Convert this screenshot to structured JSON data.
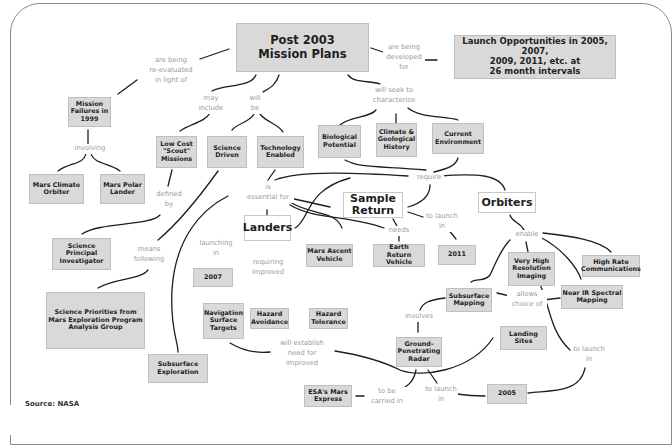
{
  "diagram": {
    "title": "Post 2003 Mission Plans",
    "source": "Source: NASA",
    "side_credit": "NASA / JOHN CHAPMAN",
    "colors": {
      "box_fill": "#d9d9d9",
      "box_border": "#bfbfbf",
      "label_text": "#9a9a9a",
      "line": "#1e1e1e",
      "frame": "#8a8a8a"
    },
    "nodes": {
      "post2003": "Post 2003\nMission Plans",
      "launch_opps": "Launch Opportunities in 2005, 2007,\n2009, 2011, etc. at\n26 month intervals",
      "mission_failures": "Mission\nFailures in\n1999",
      "mars_climate_orbiter": "Mars Climate\nOrbiter",
      "mars_polar_lander": "Mars Polar\nLander",
      "low_cost_scout": "Low Cost\n\"Scout\"\nMissions",
      "science_driven": "Science\nDriven",
      "technology_enabled": "Technology\nEnabled",
      "biological_potential": "Biological\nPotential",
      "climate_geological": "Climate &\nGeological\nHistory",
      "current_environment": "Current\nEnvironment",
      "science_pi": "Science\nPrincipal\nInvestigator",
      "science_priorities": "Science Priorities from\nMars Exploration Program\nAnalysis Group",
      "subsurface_exploration": "Subsurface\nExploration",
      "landers": "Landers",
      "sample_return": "Sample\nReturn",
      "orbiters": "Orbiters",
      "year_2007": "2007",
      "mars_ascent_vehicle": "Mars Ascent\nVehicle",
      "earth_return_vehicle": "Earth\nReturn Vehicle",
      "year_2011": "2011",
      "very_high_res_imaging": "Very High\nResolution\nImaging",
      "high_rate_comms": "High Rate\nCommunications",
      "navigation_surface_targets": "Navigation\nSurface\nTargets",
      "hazard_avoidance": "Hazard\nAvoidance",
      "hazard_tolerance": "Hazard\nTolerance",
      "subsurface_mapping": "Subsurface\nMapping",
      "near_ir_spectral": "Near IR Spectral\nMapping",
      "ground_penetrating_radar": "Ground-\nPenetrating\nRadar",
      "landing_sites": "Landing\nSites",
      "esa_mars_express": "ESA's Mars\nExpress",
      "year_2005": "2005"
    },
    "labels": {
      "re_evaluated": "are being\nre-evaluated\nin light of",
      "being_developed": "are being\ndeveloped\nfor",
      "involving": "involving",
      "may_include": "may\ninclude",
      "will_be": "will\nbe",
      "seek_characterize": "will seek to\ncharacterize",
      "defined_by": "defined\nby",
      "means_following": "means\nfollowing",
      "essential_for": "is\nessential for",
      "require": "require",
      "launching_in": "launching\nin",
      "requiring_improved": "requiring\nimproved",
      "needs": "needs",
      "to_launch_in_2011": "to launch\nin",
      "enable": "enable",
      "allows_choice": "allows\nchoice of",
      "involves": "involves",
      "will_establish": "will establish\nneed for\nimproved",
      "to_launch_in_right": "to launch\nin",
      "to_be_carried": "to be\ncarried in",
      "to_launch_in_2005": "to launch\nin"
    }
  }
}
